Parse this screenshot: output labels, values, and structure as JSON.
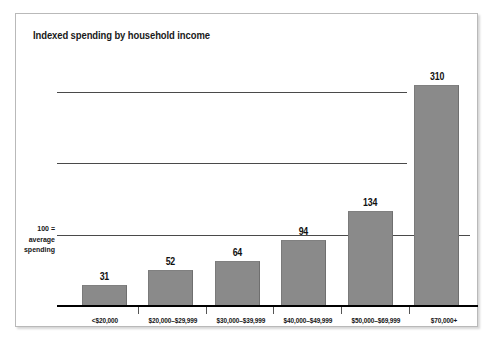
{
  "figure": {
    "title": "Indexed spending by household income",
    "axis_note_lines": [
      "100 =",
      "average",
      "spending"
    ],
    "bar_color": "#8a8a8a",
    "gridline_color": "#4a4a4a",
    "axis_color": "#000000",
    "border_color": "#b9b9b9"
  },
  "chart_data": {
    "type": "bar",
    "title": "Indexed spending by household income",
    "xlabel": "",
    "ylabel": "",
    "categories": [
      "<$20,000",
      "$20,000–$29,999",
      "$30,000–$39,999",
      "$40,000–$49,999",
      "$50,000–$69,999",
      "$70,000+"
    ],
    "values": [
      31,
      52,
      64,
      94,
      134,
      310
    ],
    "value_labels": [
      "31",
      "52",
      "64",
      "94",
      "134",
      "310"
    ],
    "ylim": [
      0,
      340
    ],
    "gridlines": [
      100,
      200,
      300
    ],
    "grid": true,
    "legend": "none",
    "annotations": [
      "100 = average spending"
    ]
  }
}
